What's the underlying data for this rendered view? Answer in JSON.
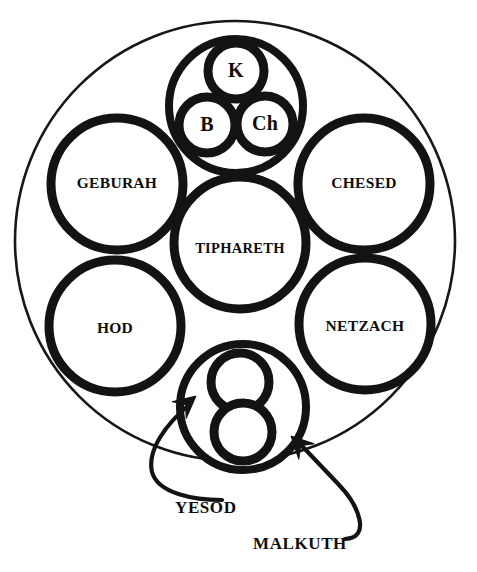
{
  "diagram": {
    "background_color": "#ffffff",
    "ink_color": "#131313",
    "outer_boundary": {
      "name": "outer-boundary-circle",
      "cx": 235,
      "cy": 241,
      "r": 220
    },
    "sephiroth": [
      {
        "id": "geburah",
        "label": "GEBURAH",
        "cx": 117,
        "cy": 184,
        "r": 66,
        "label_dy": 0
      },
      {
        "id": "chesed",
        "label": "CHESED",
        "cx": 364,
        "cy": 184,
        "r": 66,
        "label_dy": 0
      },
      {
        "id": "tiphareth",
        "label": "TIPHARETH",
        "cx": 240,
        "cy": 243,
        "r": 66,
        "label_dy": 7
      },
      {
        "id": "hod",
        "label": "HOD",
        "cx": 115,
        "cy": 326,
        "r": 66,
        "label_dy": 3
      },
      {
        "id": "netzach",
        "label": "NETZACH",
        "cx": 365,
        "cy": 324,
        "r": 66,
        "label_dy": 3
      }
    ],
    "supernal_cluster": {
      "id": "supernal-triad",
      "container": {
        "cx": 236,
        "cy": 106,
        "r": 67
      },
      "members": [
        {
          "id": "kether",
          "label": "K",
          "cx": 236,
          "cy": 71,
          "r": 28,
          "label_dy": 1
        },
        {
          "id": "binah",
          "label": "B",
          "cx": 207,
          "cy": 125,
          "r": 28,
          "label_dy": 1
        },
        {
          "id": "chokmah",
          "label": "Ch",
          "cx": 265,
          "cy": 124,
          "r": 28,
          "label_dy": 1
        }
      ]
    },
    "lower_cluster": {
      "id": "yesod-malkuth-cluster",
      "container": {
        "cx": 243,
        "cy": 407,
        "r": 63
      },
      "members": [
        {
          "id": "yesod-circle",
          "label": "",
          "cx": 240,
          "cy": 382,
          "r": 29
        },
        {
          "id": "malkuth-circle",
          "label": "",
          "cx": 243,
          "cy": 432,
          "r": 29
        }
      ]
    },
    "callouts": [
      {
        "id": "yesod",
        "label": "YESOD",
        "label_x": 175,
        "label_y": 509,
        "leader_path": "M 222 500 C 195 500 158 494 152 472 C 147 450 166 424 190 404",
        "arrow_tip": {
          "x": 196,
          "y": 396
        },
        "arrow_angle": -40
      },
      {
        "id": "malkuth",
        "label": "MALKUTH",
        "label_x": 253,
        "label_y": 545,
        "leader_path": "M 345 539 C 372 538 358 505 340 486 C 322 467 308 452 298 442",
        "arrow_tip": {
          "x": 291,
          "y": 436
        },
        "arrow_angle": -135
      }
    ]
  }
}
